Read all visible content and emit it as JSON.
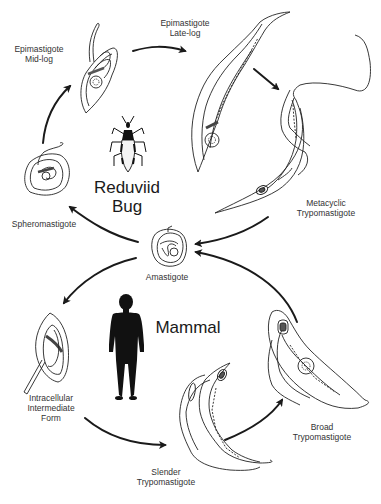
{
  "diagram": {
    "type": "life-cycle",
    "hosts": {
      "insect": {
        "line1": "Reduviid",
        "line2": "Bug"
      },
      "mammal": {
        "label": "Mammal"
      }
    },
    "stages": {
      "epi_mid": {
        "line1": "Epimastigote",
        "line2": "Mid-log"
      },
      "epi_late": {
        "line1": "Epimastigote",
        "line2": "Late-log"
      },
      "metacyclic": {
        "line1": "Metacyclic",
        "line2": "Trypomastigote"
      },
      "amastigote": {
        "line1": "Amastigote"
      },
      "spheromastigote": {
        "line1": "Spheromastigote"
      },
      "intracellular": {
        "line1": "Intracellular",
        "line2": "Intermediate",
        "line3": "Form"
      },
      "slender": {
        "line1": "Slender",
        "line2": "Trypomastigote"
      },
      "broad": {
        "line1": "Broad",
        "line2": "Trypomastigote"
      }
    },
    "flow": [
      [
        "Spheromastigote",
        "Epimastigote Mid-log"
      ],
      [
        "Epimastigote Mid-log",
        "Epimastigote Late-log"
      ],
      [
        "Epimastigote Late-log",
        "Metacyclic Trypomastigote"
      ],
      [
        "Metacyclic Trypomastigote",
        "Amastigote"
      ],
      [
        "Amastigote",
        "Spheromastigote"
      ],
      [
        "Amastigote",
        "Intracellular Intermediate Form"
      ],
      [
        "Intracellular Intermediate Form",
        "Slender Trypomastigote"
      ],
      [
        "Slender Trypomastigote",
        "Broad Trypomastigote"
      ],
      [
        "Broad Trypomastigote",
        "Amastigote"
      ]
    ],
    "colors": {
      "line": "#1a1a1a",
      "text": "#333333",
      "background": "#ffffff"
    }
  }
}
